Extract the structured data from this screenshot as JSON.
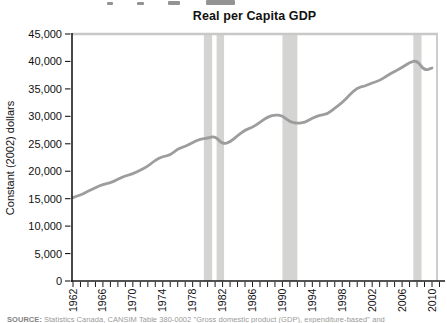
{
  "title": "Real per Capita GDP",
  "source_note": {
    "label": "SOURCE:",
    "text": "Statistics Canada, CANSIM Table 380-0002 \"Gross domestic product (GDP), expenditure-based\" and"
  },
  "chart_data": {
    "type": "line",
    "title": "Real per Capita GDP",
    "xlabel": "",
    "ylabel": "Constant (2002) dollars",
    "xlim": [
      1962,
      2010
    ],
    "ylim": [
      0,
      45000
    ],
    "grid": false,
    "legend": "none",
    "yticks": [
      0,
      5000,
      10000,
      15000,
      20000,
      25000,
      30000,
      35000,
      40000,
      45000
    ],
    "ytick_labels": [
      "0",
      "5,000",
      "10,000",
      "15,000",
      "20,000",
      "25,000",
      "30,000",
      "35,000",
      "40,000",
      "45,000"
    ],
    "xticks": [
      1962,
      1966,
      1970,
      1974,
      1978,
      1982,
      1986,
      1990,
      1994,
      1998,
      2002,
      2006,
      2010
    ],
    "xtick_labels": [
      "1962",
      "1966",
      "1970",
      "1974",
      "1978",
      "1982",
      "1986",
      "1990",
      "1994",
      "1998",
      "2002",
      "2006",
      "2010"
    ],
    "minor_xtick_every_years": 1,
    "x": [
      1962,
      1963,
      1964,
      1965,
      1966,
      1967,
      1968,
      1969,
      1970,
      1971,
      1972,
      1973,
      1974,
      1975,
      1976,
      1977,
      1978,
      1979,
      1980,
      1981,
      1982,
      1983,
      1984,
      1985,
      1986,
      1987,
      1988,
      1989,
      1990,
      1991,
      1992,
      1993,
      1994,
      1995,
      1996,
      1997,
      1998,
      1999,
      2000,
      2001,
      2002,
      2003,
      2004,
      2005,
      2006,
      2007,
      2008,
      2009,
      2010
    ],
    "series": [
      {
        "name": "Real per capita GDP (constant 2002 dollars)",
        "values": [
          15200,
          15700,
          16300,
          17000,
          17600,
          17900,
          18500,
          19200,
          19500,
          20200,
          20900,
          22000,
          22700,
          22900,
          24100,
          24500,
          25200,
          25900,
          26000,
          26400,
          24900,
          25300,
          26500,
          27500,
          28000,
          28900,
          29900,
          30300,
          30100,
          29000,
          28700,
          28900,
          29700,
          30200,
          30400,
          31500,
          32500,
          33900,
          35200,
          35500,
          36100,
          36500,
          37400,
          38200,
          38900,
          39800,
          40200,
          38300,
          38800
        ]
      }
    ],
    "recession_bands": [
      {
        "from": 1979.5,
        "to": 1980.6
      },
      {
        "from": 1981.2,
        "to": 1982.2
      },
      {
        "from": 1990.0,
        "to": 1992.0
      },
      {
        "from": 2007.5,
        "to": 2008.6
      }
    ],
    "line_color": "#9d9d9d",
    "band_color": "#d4d4d3",
    "frame_color": "#c8c8c8",
    "axis_color": "#1a1a1a"
  }
}
